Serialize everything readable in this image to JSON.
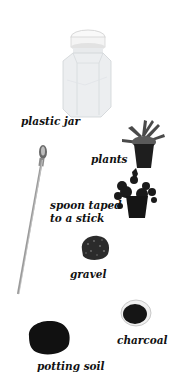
{
  "figure": {
    "items": [
      {
        "id": "plastic-jar",
        "label": "plastic jar"
      },
      {
        "id": "plants",
        "label": "plants"
      },
      {
        "id": "spoon",
        "label_line1": "spoon taped",
        "label_line2": "to a stick"
      },
      {
        "id": "gravel",
        "label": "gravel"
      },
      {
        "id": "charcoal",
        "label": "charcoal"
      },
      {
        "id": "potting-soil",
        "label": "potting soil"
      }
    ]
  },
  "colors": {
    "background": "#ffffff",
    "text": "#111111",
    "jar": "#e6e8ea",
    "lid": "#f7f7f7",
    "plant_leaf": "#3a3a3a",
    "pot": "#1e1e1e",
    "soil": "#111111",
    "gravel": "#2b2b2b",
    "spoon": "#9a9a9a"
  }
}
